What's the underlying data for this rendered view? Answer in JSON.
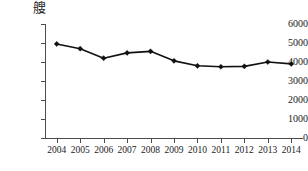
{
  "chart_data": {
    "type": "line",
    "title": "",
    "xlabel": "",
    "ylabel": "",
    "unit_label": "艘",
    "categories": [
      "2004",
      "2005",
      "2006",
      "2007",
      "2008",
      "2009",
      "2010",
      "2011",
      "2012",
      "2013",
      "2014"
    ],
    "values": [
      4950,
      4700,
      4200,
      4480,
      4560,
      4060,
      3800,
      3750,
      3770,
      4000,
      3900
    ],
    "series": [
      {
        "name": "",
        "values": [
          4950,
          4700,
          4200,
          4480,
          4560,
          4060,
          3800,
          3750,
          3770,
          4000,
          3900
        ]
      }
    ],
    "ylim": [
      0,
      6000
    ],
    "yticks": [
      0,
      1000,
      2000,
      3000,
      4000,
      5000,
      6000
    ],
    "ytick_labels": [
      "0",
      "1000",
      "2000",
      "3000",
      "4000",
      "5000",
      "6000"
    ],
    "grid": false,
    "legend": false,
    "legend_position": "none",
    "marker": "diamond",
    "line_color": "#111111",
    "axis_color": "#4d4d4d",
    "background": "#ffffff"
  }
}
